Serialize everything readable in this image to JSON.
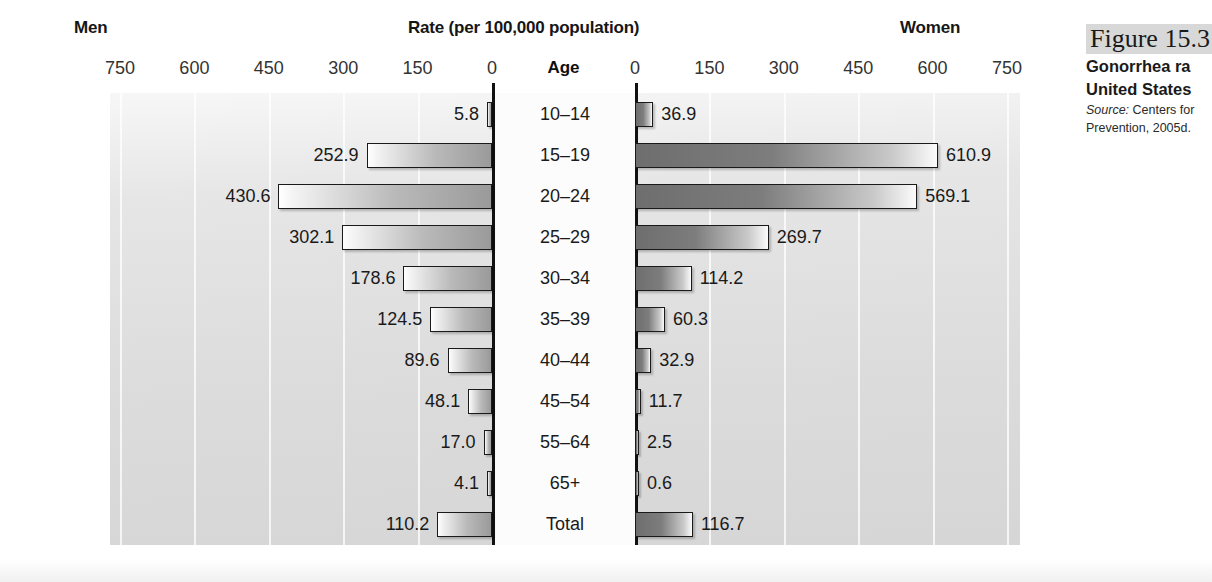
{
  "header": {
    "left_label": "Men",
    "right_label": "Women",
    "title": "Rate (per 100,000 population)",
    "age_label": "Age"
  },
  "caption": {
    "figure_number": "Figure 15.3",
    "title_line1": "Gonorrhea ra",
    "title_line2": "United States",
    "source_label": "Source:",
    "source_line1": "Centers for",
    "source_line2": "Prevention, 2005d."
  },
  "axis": {
    "ticks": [
      "750",
      "600",
      "450",
      "300",
      "150",
      "0",
      "0",
      "150",
      "300",
      "450",
      "600",
      "750"
    ],
    "max": 750,
    "tick_step": 150
  },
  "chart_data": {
    "type": "bar",
    "orientation": "horizontal-diverging",
    "xlabel": "Rate (per 100,000 population)",
    "ylabel": "Age",
    "xlim": [
      0,
      750
    ],
    "grid": true,
    "legend": [
      "Men",
      "Women"
    ],
    "legend_position": "top-outside",
    "categories": [
      "10–14",
      "15–19",
      "20–24",
      "25–29",
      "30–34",
      "35–39",
      "40–44",
      "45–54",
      "55–64",
      "65+",
      "Total"
    ],
    "series": [
      {
        "name": "Men",
        "direction": "left",
        "values": [
          5.8,
          252.9,
          430.6,
          302.1,
          178.6,
          124.5,
          89.6,
          48.1,
          17.0,
          4.1,
          110.2
        ],
        "labels": [
          "5.8",
          "252.9",
          "430.6",
          "302.1",
          "178.6",
          "124.5",
          "89.6",
          "48.1",
          "17.0",
          "4.1",
          "110.2"
        ]
      },
      {
        "name": "Women",
        "direction": "right",
        "values": [
          36.9,
          610.9,
          569.1,
          269.7,
          114.2,
          60.3,
          32.9,
          11.7,
          2.5,
          0.6,
          116.7
        ],
        "labels": [
          "36.9",
          "610.9",
          "569.1",
          "269.7",
          "114.2",
          "60.3",
          "32.9",
          "11.7",
          "2.5",
          "0.6",
          "116.7"
        ]
      }
    ]
  }
}
